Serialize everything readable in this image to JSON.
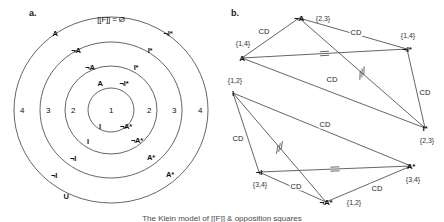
{
  "figure": {
    "panel_a_label": "a.",
    "panel_b_label": "b.",
    "caption": "The Klein model of [[F]] & opposition squares"
  },
  "panel_a": {
    "type": "concentric-rings-venn",
    "top_formula": "[[F]] = Ø",
    "bottom_label": "U",
    "ring_numbers": [
      "4",
      "3",
      "2",
      "1",
      "2",
      "3",
      "4"
    ],
    "left_labels": [
      "A",
      "¬A",
      "¬A",
      "A"
    ],
    "right_labels": [
      "¬I*",
      "I*",
      "I*",
      "¬I*"
    ],
    "lower_left_labels": [
      "I",
      "¬I",
      "¬I"
    ],
    "lower_right_labels": [
      "¬A*",
      "A*",
      "A*"
    ],
    "labels": [
      {
        "text": "[[F]] = Ø",
        "x": 111,
        "y": 19,
        "kind": "topf"
      },
      {
        "text": "A",
        "x": 55,
        "y": 33,
        "kind": "bold"
      },
      {
        "text": "¬I*",
        "x": 168,
        "y": 33,
        "kind": "bold"
      },
      {
        "text": "¬A",
        "x": 76,
        "y": 50,
        "kind": "bold"
      },
      {
        "text": "I*",
        "x": 150,
        "y": 50,
        "kind": "bold"
      },
      {
        "text": "¬A",
        "x": 90,
        "y": 67,
        "kind": "bold"
      },
      {
        "text": "I*",
        "x": 136,
        "y": 67,
        "kind": "bold"
      },
      {
        "text": "A",
        "x": 100,
        "y": 83,
        "kind": "bold"
      },
      {
        "text": "¬I*",
        "x": 124,
        "y": 83,
        "kind": "bold"
      },
      {
        "text": "4",
        "x": 22,
        "y": 110,
        "kind": "num"
      },
      {
        "text": "3",
        "x": 48,
        "y": 110,
        "kind": "num"
      },
      {
        "text": "2",
        "x": 73,
        "y": 110,
        "kind": "num"
      },
      {
        "text": "1",
        "x": 111,
        "y": 110,
        "kind": "num"
      },
      {
        "text": "2",
        "x": 149,
        "y": 110,
        "kind": "num"
      },
      {
        "text": "3",
        "x": 174,
        "y": 110,
        "kind": "num"
      },
      {
        "text": "4",
        "x": 200,
        "y": 110,
        "kind": "num"
      },
      {
        "text": "I",
        "x": 100,
        "y": 126,
        "kind": "bold"
      },
      {
        "text": "¬A*",
        "x": 126,
        "y": 126,
        "kind": "bold"
      },
      {
        "text": "I",
        "x": 88,
        "y": 141,
        "kind": "bold"
      },
      {
        "text": "¬A*",
        "x": 137,
        "y": 140,
        "kind": "bold"
      },
      {
        "text": "¬I",
        "x": 73,
        "y": 158,
        "kind": "bold"
      },
      {
        "text": "A*",
        "x": 151,
        "y": 157,
        "kind": "bold"
      },
      {
        "text": "¬I",
        "x": 54,
        "y": 175,
        "kind": "bold"
      },
      {
        "text": "A*",
        "x": 170,
        "y": 174,
        "kind": "bold"
      },
      {
        "text": "U",
        "x": 66,
        "y": 196,
        "kind": "bold"
      }
    ],
    "rings": [
      {
        "cx": 111,
        "cy": 110,
        "rx": 97,
        "ry": 93
      },
      {
        "cx": 111,
        "cy": 110,
        "rx": 71,
        "ry": 68
      },
      {
        "cx": 111,
        "cy": 110,
        "rx": 46,
        "ry": 44
      },
      {
        "cx": 111,
        "cy": 110,
        "rx": 23,
        "ry": 22
      }
    ]
  },
  "panel_b": {
    "type": "two-opposition-squares",
    "edge_label": "CD",
    "nodes": [
      {
        "id": "A",
        "label": "A",
        "set": "{1,4}",
        "x": 20,
        "y": 58,
        "set_x": 21,
        "set_y": 43
      },
      {
        "id": "notA",
        "label": "¬A",
        "set": "{2,3}",
        "x": 77,
        "y": 18,
        "set_x": 101,
        "set_y": 18
      },
      {
        "id": "notIs",
        "label": "¬I*",
        "set": "{1,4}",
        "x": 185,
        "y": 49,
        "set_x": 186,
        "set_y": 35
      },
      {
        "id": "Istar",
        "label": "I*",
        "set": "{2,3}",
        "x": 203,
        "y": 128,
        "set_x": 205,
        "set_y": 140
      },
      {
        "id": "I",
        "label": "I",
        "set": "{1,2}",
        "x": 11,
        "y": 93,
        "set_x": 13,
        "set_y": 80
      },
      {
        "id": "notI",
        "label": "¬I",
        "set": "{3,4}",
        "x": 37,
        "y": 172,
        "set_x": 38,
        "set_y": 184
      },
      {
        "id": "notAs",
        "label": "¬A*",
        "set": "{1,2}",
        "x": 104,
        "y": 202,
        "set_x": 132,
        "set_y": 202
      },
      {
        "id": "Astar",
        "label": "A*",
        "set": "{3,4}",
        "x": 189,
        "y": 166,
        "set_x": 191,
        "set_y": 179
      }
    ],
    "edges": [
      {
        "from": "A",
        "to": "notA",
        "label": "CD",
        "lx": 42,
        "ly": 31,
        "mark": "none"
      },
      {
        "from": "notA",
        "to": "notIs",
        "label": "CD",
        "lx": 134,
        "ly": 32,
        "mark": "none"
      },
      {
        "from": "A",
        "to": "notIs",
        "label": "",
        "lx": 0,
        "ly": 0,
        "mark": "eq"
      },
      {
        "from": "notIs",
        "to": "Istar",
        "label": "CD",
        "lx": 203,
        "ly": 92,
        "mark": "none"
      },
      {
        "from": "notA",
        "to": "Istar",
        "label": "",
        "lx": 0,
        "ly": 0,
        "mark": "hash"
      },
      {
        "from": "A",
        "to": "Istar",
        "label": "CD",
        "lx": 110,
        "ly": 79,
        "mark": "none"
      },
      {
        "from": "I",
        "to": "notI",
        "label": "CD",
        "lx": 16,
        "ly": 138,
        "mark": "none"
      },
      {
        "from": "notI",
        "to": "notAs",
        "label": "CD",
        "lx": 74,
        "ly": 186,
        "mark": "none"
      },
      {
        "from": "I",
        "to": "notAs",
        "label": "",
        "lx": 0,
        "ly": 0,
        "mark": "hash"
      },
      {
        "from": "notI",
        "to": "Astar",
        "label": "",
        "lx": 0,
        "ly": 0,
        "mark": "eq"
      },
      {
        "from": "notAs",
        "to": "Astar",
        "label": "CD",
        "lx": 155,
        "ly": 188,
        "mark": "none"
      },
      {
        "from": "I",
        "to": "Astar",
        "label": "CD",
        "lx": 103,
        "ly": 124,
        "mark": "none"
      }
    ]
  }
}
